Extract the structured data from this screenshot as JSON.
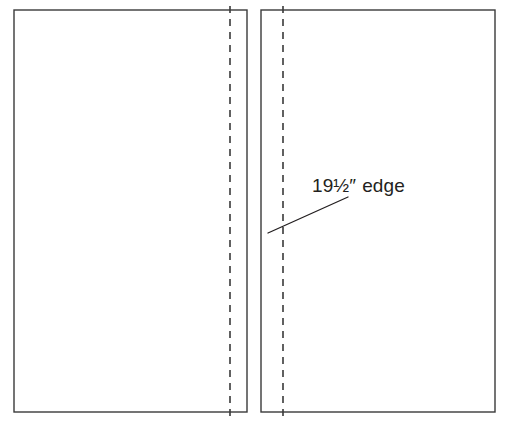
{
  "diagram": {
    "background_color": "#ffffff",
    "stroke_color": "#3a3a3a",
    "text_color": "#231f20",
    "panels": [
      {
        "name": "left-panel",
        "x": 14,
        "y": 10,
        "width": 233,
        "height": 402,
        "fold_line_x": 230,
        "fold_line_top": 6,
        "fold_line_bottom": 417
      },
      {
        "name": "right-panel",
        "x": 261,
        "y": 10,
        "width": 234,
        "height": 402,
        "fold_line_x": 283,
        "fold_line_top": 6,
        "fold_line_bottom": 417
      }
    ],
    "callout": {
      "label_value": "19",
      "label_fraction_numerator": "1",
      "label_fraction_denominator": "2",
      "label_fraction": "½",
      "label_unit": "″",
      "label_word": "edge",
      "label_full": "19½″ edge",
      "text_x": 312,
      "text_baseline_y": 192,
      "leader_from_x": 268,
      "leader_from_y": 233,
      "leader_to_x": 348,
      "leader_to_y": 197
    },
    "stroke_widths": {
      "panel_outline": 1.4,
      "fold_line": 1.6,
      "leader_line": 1.3
    },
    "fold_dash_pattern": "7 6"
  }
}
